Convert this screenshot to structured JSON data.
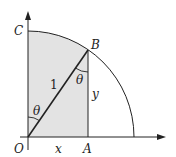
{
  "diagram": {
    "labels": {
      "origin": "O",
      "point_a": "A",
      "point_b": "B",
      "point_c": "C",
      "hypotenuse": "1",
      "adjacent": "x",
      "opposite": "y",
      "angle_at_o": "θ",
      "angle_at_b": "θ"
    },
    "colors": {
      "shade": "#e3e3e3",
      "stroke": "#222222"
    }
  }
}
